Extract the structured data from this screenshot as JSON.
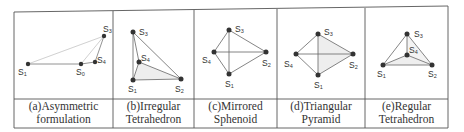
{
  "figure": {
    "frame_color": "#555555",
    "edge_color": "#666666",
    "light_edge_color": "#b0b0b0",
    "node_color": "#333333",
    "face_fill": "#eeeeee",
    "panels": [
      {
        "id": "a",
        "caption_line1": "(a)Asymmetric",
        "caption_line2": "formulation",
        "nodes": [
          {
            "name": "S1",
            "label": "S",
            "sub": "1",
            "x": 28,
            "y": 64
          },
          {
            "name": "S0",
            "label": "S",
            "sub": "0",
            "x": 81,
            "y": 64
          },
          {
            "name": "S4",
            "label": "S",
            "sub": "4",
            "x": 95,
            "y": 62
          },
          {
            "name": "S3",
            "label": "S",
            "sub": "3",
            "x": 104,
            "y": 36
          }
        ]
      },
      {
        "id": "b",
        "caption_line1": "(b)Irregular",
        "caption_line2": "Tetrahedron",
        "nodes": [
          {
            "name": "S3",
            "label": "S",
            "sub": "3",
            "x": 133,
            "y": 32
          },
          {
            "name": "S4",
            "label": "S",
            "sub": "4",
            "x": 139,
            "y": 62
          },
          {
            "name": "S1",
            "label": "S",
            "sub": "1",
            "x": 133,
            "y": 80
          },
          {
            "name": "S2",
            "label": "S",
            "sub": "2",
            "x": 181,
            "y": 79
          }
        ]
      },
      {
        "id": "c",
        "caption_line1": "(c)Mirrored",
        "caption_line2": "Sphenoid",
        "nodes": [
          {
            "name": "S3",
            "label": "S",
            "sub": "3",
            "x": 229,
            "y": 30
          },
          {
            "name": "S4",
            "label": "S",
            "sub": "4",
            "x": 214,
            "y": 52
          },
          {
            "name": "S2",
            "label": "S",
            "sub": "2",
            "x": 266,
            "y": 52
          },
          {
            "name": "S1",
            "label": "S",
            "sub": "1",
            "x": 229,
            "y": 74
          }
        ]
      },
      {
        "id": "d",
        "caption_line1": "(d)Triangular",
        "caption_line2": "Pyramid",
        "nodes": [
          {
            "name": "S3",
            "label": "S",
            "sub": "3",
            "x": 318,
            "y": 34
          },
          {
            "name": "S4",
            "label": "S",
            "sub": "4",
            "x": 296,
            "y": 54
          },
          {
            "name": "S2",
            "label": "S",
            "sub": "2",
            "x": 353,
            "y": 54
          },
          {
            "name": "S1",
            "label": "S",
            "sub": "1",
            "x": 318,
            "y": 75
          }
        ]
      },
      {
        "id": "e",
        "caption_line1": "(e)Regular",
        "caption_line2": "Tetrahedron",
        "nodes": [
          {
            "name": "S3",
            "label": "S",
            "sub": "3",
            "x": 407,
            "y": 34
          },
          {
            "name": "S4",
            "label": "S",
            "sub": "4",
            "x": 407,
            "y": 55
          },
          {
            "name": "S1",
            "label": "S",
            "sub": "1",
            "x": 383,
            "y": 65
          },
          {
            "name": "S2",
            "label": "S",
            "sub": "2",
            "x": 432,
            "y": 65
          }
        ]
      }
    ]
  }
}
